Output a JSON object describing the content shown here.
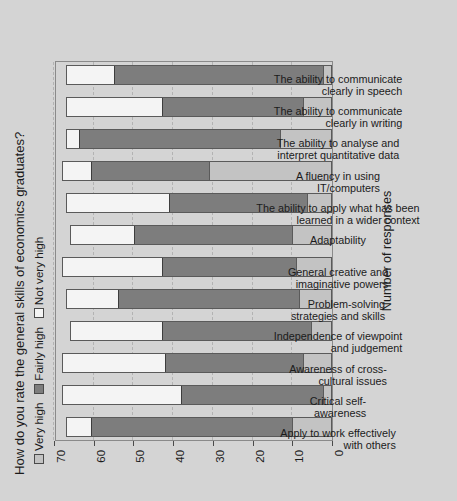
{
  "chart_data": {
    "type": "bar",
    "subtype": "stacked-bar",
    "orientation": "vertical-rotated-90ccw",
    "title": "How do you rate the general skills of economics graduates?",
    "xlabel": "",
    "ylabel": "Number of responses",
    "ylim": [
      0,
      70
    ],
    "yticks": [
      0,
      10,
      20,
      30,
      40,
      50,
      60,
      70
    ],
    "grid": true,
    "legend_position": "top-left",
    "categories": [
      "Apply to work effectively with others",
      "Critical self-awareness",
      "Awareness of cross-cultural issues",
      "Independence of viewpoint and judgement",
      "Problem-solving strategies and skills",
      "General creative and imaginative powers",
      "Adaptability",
      "The ability to apply what has been learned in a wider context",
      "A fluency in using IT/computers",
      "The ability to analyse and interpret quantitative data",
      "The ability to communicate clearly in writing",
      "The ability to communicate clearly in speech"
    ],
    "category_lines": [
      [
        "Apply to work effectively",
        "with others"
      ],
      [
        "Critical self-",
        "awareness"
      ],
      [
        "Awareness of cross-",
        "cultural issues"
      ],
      [
        "Independence of viewpoint",
        "and judgement"
      ],
      [
        "Problem-solving",
        "strategies and skills"
      ],
      [
        "General creative and",
        "imaginative powers"
      ],
      [
        "Adaptability"
      ],
      [
        "The ability to apply what has been",
        "learned in a wider context"
      ],
      [
        "A fluency in using",
        "IT/computers"
      ],
      [
        "The ability to analyse and",
        "interpret quantitative data"
      ],
      [
        "The ability to communicate",
        "clearly in writing"
      ],
      [
        "The ability to communicate",
        "clearly in speech"
      ]
    ],
    "series": [
      {
        "name": "Very high",
        "color": "#c3c3c3",
        "values": [
          10,
          2,
          7,
          5,
          8,
          9,
          10,
          6,
          31,
          13,
          7,
          2
        ]
      },
      {
        "name": "Fairly high",
        "color": "#7d7d7d",
        "values": [
          51,
          36,
          35,
          38,
          46,
          34,
          40,
          35,
          30,
          51,
          36,
          53
        ]
      },
      {
        "name": "Not very high",
        "color": "#f4f4f4",
        "values": [
          6,
          30,
          26,
          23,
          13,
          25,
          16,
          26,
          7,
          3,
          24,
          12
        ]
      }
    ],
    "totals": [
      67,
      68,
      68,
      66,
      67,
      68,
      66,
      67,
      68,
      67,
      67,
      67
    ]
  },
  "legend": {
    "items": [
      {
        "label": "Very high",
        "swatch": "vh"
      },
      {
        "label": "Fairly high",
        "swatch": "fh"
      },
      {
        "label": "Not very high",
        "swatch": "nh"
      }
    ]
  }
}
